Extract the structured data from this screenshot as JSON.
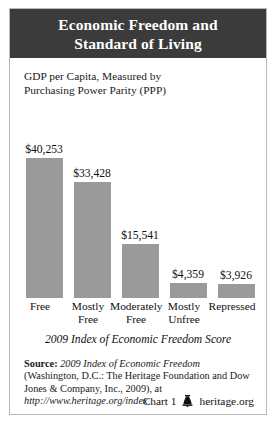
{
  "title": {
    "line1": "Economic Freedom and",
    "line2": "Standard of Living"
  },
  "subtitle": {
    "line1": "GDP per Capita, Measured by",
    "line2": "Purchasing Power Parity (PPP)"
  },
  "chart_data": {
    "type": "bar",
    "title": "Economic Freedom and Standard of Living",
    "subtitle": "GDP per Capita, Measured by Purchasing Power Parity (PPP)",
    "xlabel": "2009 Index of Economic Freedom Score",
    "ylabel": "GDP per Capita (PPP)",
    "categories": [
      "Free",
      "Mostly Free",
      "Moderately Free",
      "Mostly Unfree",
      "Repressed"
    ],
    "category_lines": [
      [
        "Free"
      ],
      [
        "Mostly",
        "Free"
      ],
      [
        "Moderately",
        "Free"
      ],
      [
        "Mostly",
        "Unfree"
      ],
      [
        "Repressed"
      ]
    ],
    "values": [
      40253,
      33428,
      15541,
      4359,
      3926
    ],
    "value_labels": [
      "$40,253",
      "$33,428",
      "$15,541",
      "$4,359",
      "$3,926"
    ],
    "ylim": [
      0,
      40253
    ],
    "grid": false,
    "legend": false,
    "bar_color": "#9a9a9a"
  },
  "axis_caption": "2009 Index of Economic Freedom Score",
  "source": {
    "label": "Source:",
    "title": "2009 Index of Economic Freedom",
    "text_mid": " (Washington, D.C.: The Heritage Foundation and Dow Jones & Company, Inc., 2009), at ",
    "url": "http://www.heritage.org/index"
  },
  "footer": {
    "chart_number": "Chart 1",
    "site": "heritage.org",
    "icon": "liberty-bell-icon"
  },
  "colors": {
    "header_bg": "#3b3b3b",
    "bar": "#9a9a9a",
    "border": "#b9b9b9",
    "text": "#111111"
  }
}
